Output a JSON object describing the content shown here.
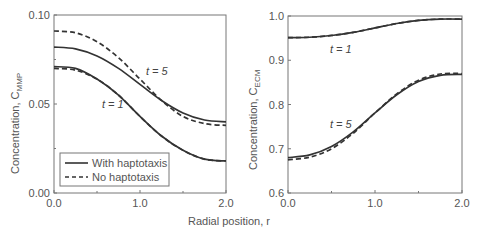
{
  "chart_data": [
    {
      "type": "line",
      "panel": "left",
      "xlabel": "Radial position, r",
      "ylabel": "Concentration, C_MMP",
      "ylabel_main": "Concentration, C",
      "ylabel_sub": "MMP",
      "xlim": [
        0,
        2
      ],
      "ylim": [
        0,
        0.1
      ],
      "xticks": [
        "0.0",
        "1.0",
        "2.0"
      ],
      "yticks": [
        "0.00",
        "0.05",
        "0.10"
      ],
      "legend": [
        "With haptotaxis",
        "No haptotaxis"
      ],
      "legend_position": "lower left",
      "annotations": [
        "t = 5",
        "t = 1"
      ],
      "x": [
        0.0,
        0.25,
        0.5,
        0.75,
        1.0,
        1.25,
        1.5,
        1.75,
        2.0
      ],
      "series": [
        {
          "name": "With haptotaxis, t=5",
          "style": "solid",
          "values": [
            0.082,
            0.081,
            0.077,
            0.07,
            0.061,
            0.052,
            0.045,
            0.041,
            0.04
          ]
        },
        {
          "name": "No haptotaxis, t=5",
          "style": "dashed",
          "values": [
            0.091,
            0.09,
            0.085,
            0.076,
            0.064,
            0.052,
            0.043,
            0.039,
            0.038
          ]
        },
        {
          "name": "With haptotaxis, t=1",
          "style": "solid",
          "values": [
            0.071,
            0.07,
            0.064,
            0.055,
            0.043,
            0.032,
            0.024,
            0.019,
            0.018
          ]
        },
        {
          "name": "No haptotaxis, t=1",
          "style": "dashed",
          "values": [
            0.07,
            0.069,
            0.064,
            0.055,
            0.043,
            0.032,
            0.024,
            0.019,
            0.018
          ]
        }
      ]
    },
    {
      "type": "line",
      "panel": "right",
      "xlabel": "Radial position, r",
      "ylabel": "Concentration, C_ECM",
      "ylabel_main": "Concentration, C",
      "ylabel_sub": "ECM",
      "xlim": [
        0,
        2
      ],
      "ylim": [
        0.6,
        1.0
      ],
      "xticks": [
        "0.0",
        "1.0",
        "2.0"
      ],
      "yticks": [
        "0.6",
        "0.7",
        "0.8",
        "0.9",
        "1.0"
      ],
      "annotations": [
        "t = 1",
        "t = 5"
      ],
      "x": [
        0.0,
        0.25,
        0.5,
        0.75,
        1.0,
        1.25,
        1.5,
        1.75,
        2.0
      ],
      "series": [
        {
          "name": "With haptotaxis, t=1",
          "style": "solid",
          "values": [
            0.951,
            0.952,
            0.956,
            0.963,
            0.973,
            0.983,
            0.99,
            0.993,
            0.993
          ]
        },
        {
          "name": "No haptotaxis, t=1",
          "style": "dashed",
          "values": [
            0.951,
            0.952,
            0.956,
            0.963,
            0.973,
            0.983,
            0.99,
            0.993,
            0.993
          ]
        },
        {
          "name": "With haptotaxis, t=5",
          "style": "solid",
          "values": [
            0.68,
            0.686,
            0.705,
            0.738,
            0.781,
            0.822,
            0.852,
            0.866,
            0.868
          ]
        },
        {
          "name": "No haptotaxis, t=5",
          "style": "dashed",
          "values": [
            0.675,
            0.681,
            0.7,
            0.735,
            0.781,
            0.824,
            0.855,
            0.869,
            0.87
          ]
        }
      ]
    }
  ],
  "labels": {
    "shared_xlabel": "Radial position, r",
    "left_t5": "t = 5",
    "left_t1": "t = 1",
    "right_t1": "t = 1",
    "right_t5": "t = 5",
    "legend_with": "With haptotaxis",
    "legend_no": "No haptotaxis"
  }
}
